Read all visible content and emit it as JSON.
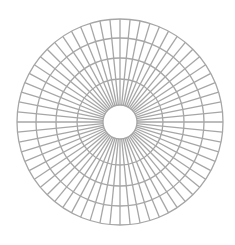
{
  "diagram": {
    "type": "radial-grid",
    "center": {
      "x": 120,
      "y": 122
    },
    "ring_radii": [
      17,
      43,
      64,
      84,
      103
    ],
    "spoke_count": 64,
    "spoke_inner_radius": 17,
    "spoke_outer_radius": 103,
    "stroke_color": "#a6a6a6",
    "stroke_width": 1.3,
    "background": "#ffffff"
  }
}
